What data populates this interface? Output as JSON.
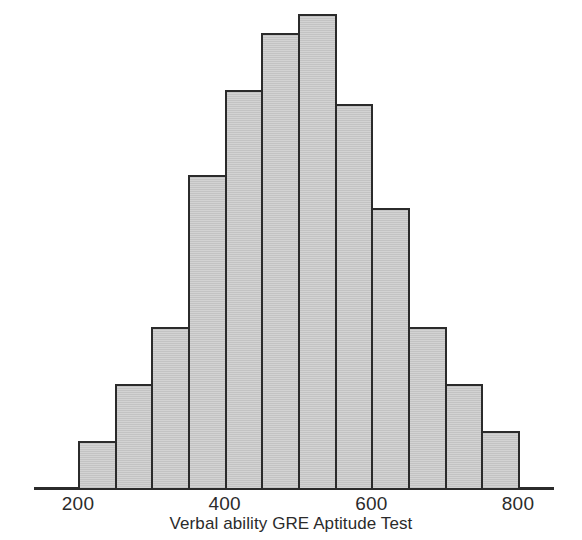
{
  "figure": {
    "background_color": "#ffffff",
    "axis_color": "#2b2b2b",
    "bar_fill_color": "#c6c6c6",
    "bar_edge_color": "#2b2b2b"
  },
  "axis": {
    "x_title": "Verbal ability GRE Aptitude Test",
    "tick_labels": [
      "200",
      "400",
      "600",
      "800"
    ],
    "tick_values": [
      200,
      400,
      600,
      800
    ]
  },
  "chart_data": {
    "type": "bar",
    "title": "",
    "subtitle": "",
    "xlabel": "Verbal ability GRE Aptitude Test",
    "ylabel": "",
    "xlim": [
      200,
      800
    ],
    "ylim": [
      0,
      1.0
    ],
    "grid": false,
    "legend": false,
    "bin_width": 50,
    "categories": [
      "200-250",
      "250-300",
      "300-350",
      "350-400",
      "400-450",
      "450-500",
      "500-550",
      "550-600",
      "600-650",
      "650-700",
      "700-750",
      "750-800"
    ],
    "bin_edges": [
      200,
      250,
      300,
      350,
      400,
      450,
      500,
      550,
      600,
      650,
      700,
      750,
      800
    ],
    "bin_centers": [
      225,
      275,
      325,
      375,
      425,
      475,
      525,
      575,
      625,
      675,
      725,
      775
    ],
    "values": [
      0.1,
      0.22,
      0.34,
      0.66,
      0.84,
      0.96,
      1.0,
      0.81,
      0.59,
      0.34,
      0.22,
      0.12
    ],
    "annotations": []
  }
}
